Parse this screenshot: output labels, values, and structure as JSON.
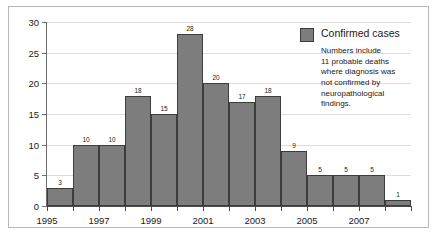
{
  "chart_data": {
    "type": "bar",
    "title": "",
    "subtitle": "",
    "xlabel": "",
    "ylabel": "",
    "categories": [
      "1995",
      "1996",
      "1997",
      "1998",
      "1999",
      "2000",
      "2001",
      "2002",
      "2003",
      "2004",
      "2005",
      "2006",
      "2007",
      "2008"
    ],
    "values": [
      3,
      10,
      10,
      18,
      15,
      28,
      20,
      17,
      18,
      9,
      5,
      5,
      5,
      1
    ],
    "bar_labels": [
      "3",
      "10",
      "10",
      "18",
      "15",
      "28",
      "20",
      "17",
      "18",
      "9",
      "5",
      "5",
      "5",
      "1"
    ],
    "ylim": [
      0,
      30
    ],
    "yticks": [
      0,
      5,
      10,
      15,
      20,
      25,
      30
    ],
    "ytick_labels": [
      "0",
      "5",
      "10",
      "15",
      "20",
      "25",
      "30"
    ],
    "xlim": [
      "1995",
      "2009"
    ],
    "xtick_labels_shown": [
      "1995",
      "1997",
      "1999",
      "2001",
      "2003",
      "2005",
      "2007"
    ],
    "xticks_all": [
      "1995",
      "1996",
      "1997",
      "1998",
      "1999",
      "2000",
      "2001",
      "2002",
      "2003",
      "2004",
      "2005",
      "2006",
      "2007",
      "2008",
      "2009"
    ],
    "grid": true,
    "grid_axis": "y",
    "legend_position": "top-right",
    "series": [
      {
        "name": "Confirmed cases",
        "color": "#7d7d7d",
        "values": [
          3,
          10,
          10,
          18,
          15,
          28,
          20,
          17,
          18,
          9,
          5,
          5,
          5,
          1
        ]
      }
    ],
    "annotations": [
      "Numbers include 11 probable deaths where diagnosis was not confirmed by neuropathological findings."
    ]
  },
  "legend": {
    "title": "Confirmed cases",
    "note_lines": [
      "Numbers include",
      "11 probable deaths",
      "where diagnosis was",
      "not confirmed by",
      "neuropathological",
      "findings."
    ],
    "swatch_color": "#7d7d7d"
  },
  "colors": {
    "bar_fill": "#7d7d7d",
    "bar_stroke": "#3c3c3c",
    "gridline": "#dedede",
    "axis": "#4a4a4a",
    "frame": "#b9b9b9",
    "text": "#1a1a1a",
    "background": "#ffffff"
  }
}
